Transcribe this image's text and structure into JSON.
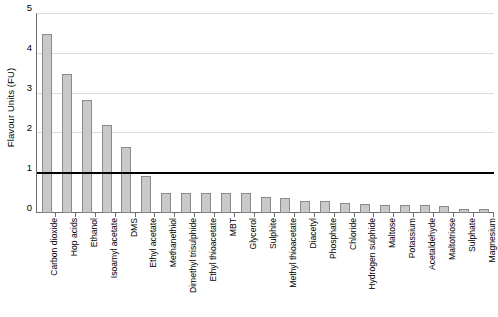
{
  "chart_data": {
    "type": "bar",
    "title": "",
    "xlabel": "",
    "ylabel": "Flavour Units (FU)",
    "ylim": [
      0,
      5
    ],
    "yticks": [
      0,
      1,
      2,
      3,
      4,
      5
    ],
    "ytick_labels": [
      "0",
      "1",
      "2",
      "3",
      "4",
      "5"
    ],
    "grid": true,
    "legend": "none",
    "bar_color": "#c9c9c9",
    "bar_edge_color": "#8a8a8a",
    "gridline_color": "#dcdcdc",
    "axis_color": "#6e6e6e",
    "threshold_line": {
      "value": 1,
      "color": "#000000",
      "label": ""
    },
    "categories": [
      "Carbon dioxide",
      "Hop acids",
      "Ethanol",
      "Isoamyl acetate",
      "DMS",
      "Ethyl acetate",
      "Methanethiol",
      "Dimethyl trisulphide",
      "Ethyl thioacetate",
      "MBT",
      "Glycerol",
      "Sulphite",
      "Methyl thioacetate",
      "Diacetyl",
      "Phosphate",
      "Chloride",
      "Hydrogen sulphide",
      "Maltose",
      "Potassium",
      "Acetaldehyde",
      "Maltotriose",
      "Sulphate",
      "Magnesium"
    ],
    "values": [
      4.5,
      3.5,
      2.85,
      2.2,
      1.65,
      0.92,
      0.5,
      0.5,
      0.5,
      0.5,
      0.5,
      0.4,
      0.38,
      0.3,
      0.3,
      0.25,
      0.22,
      0.2,
      0.2,
      0.2,
      0.18,
      0.1,
      0.1
    ]
  }
}
